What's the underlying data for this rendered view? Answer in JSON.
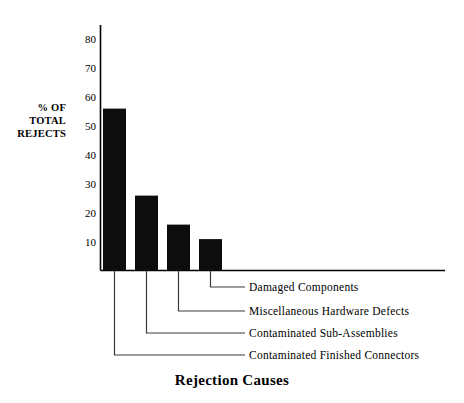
{
  "chart_data": {
    "type": "bar",
    "title": "Rejection Causes",
    "subtitle": "",
    "xlabel": "Rejection Causes",
    "ylabel": "% OF TOTAL REJECTS",
    "ylabel_lines": [
      "% OF",
      "TOTAL",
      "REJECTS"
    ],
    "categories": [
      "Contaminated Finished Connectors",
      "Contaminated Sub-Assemblies",
      "Miscellaneous Hardware Defects",
      "Damaged Components"
    ],
    "values": [
      56,
      26,
      16,
      11
    ],
    "ylim": [
      0,
      85
    ],
    "yticks": [
      10,
      20,
      30,
      40,
      50,
      60,
      70,
      80
    ],
    "ytick_labels": [
      "10",
      "20",
      "30",
      "40",
      "50",
      "60",
      "70",
      "80"
    ],
    "grid": false,
    "legend_position": "callout-leader-lines",
    "bar_color": "#000000",
    "axis_color": "#000000",
    "annotations": [
      {
        "label": "Damaged Components",
        "series_index": 3
      },
      {
        "label": "Miscellaneous Hardware Defects",
        "series_index": 2
      },
      {
        "label": "Contaminated Sub-Assemblies",
        "series_index": 1
      },
      {
        "label": "Contaminated Finished Connectors",
        "series_index": 0
      }
    ]
  },
  "axis": {
    "ytick_labels": [
      "80",
      "70",
      "60",
      "50",
      "40",
      "30",
      "20",
      "10"
    ]
  },
  "callouts": [
    {
      "label": "Damaged Components"
    },
    {
      "label": "Miscellaneous Hardware Defects"
    },
    {
      "label": "Contaminated Sub-Assemblies"
    },
    {
      "label": "Contaminated Finished Connectors"
    }
  ],
  "colors": {
    "background": "#ffffff",
    "ink": "#000000",
    "bar_fill": "#0d0d0d",
    "leader_line": "#3a3a3a"
  }
}
